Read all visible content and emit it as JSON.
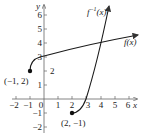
{
  "figure": {
    "x_axis_label": "x",
    "y_axis_label": "y",
    "x_ticks": [
      "−2",
      "−1",
      "0",
      "1",
      "2",
      "3",
      "4",
      "5",
      "6"
    ],
    "y_ticks": [
      "−2",
      "−1",
      "1",
      "2",
      "3",
      "4",
      "5",
      "6"
    ],
    "curves": [
      {
        "name": "f",
        "label": "f(x)",
        "formula": "2 + sqrt(x + 1)",
        "start_point": "(−1, 2)"
      },
      {
        "name": "f_inverse",
        "label_base": "f",
        "label_sup": "−1",
        "label_arg": "(x)",
        "formula": "(x − 2)^2 − 1",
        "start_point": "(2, −1)"
      }
    ],
    "points": [
      {
        "label": "(−1, 2)",
        "x": -1,
        "y": 2
      },
      {
        "label": "(2, −1)",
        "x": 2,
        "y": -1
      }
    ],
    "colors": {
      "axes": "#555555",
      "curves": "#1a1a1a",
      "text": "#222222"
    }
  }
}
